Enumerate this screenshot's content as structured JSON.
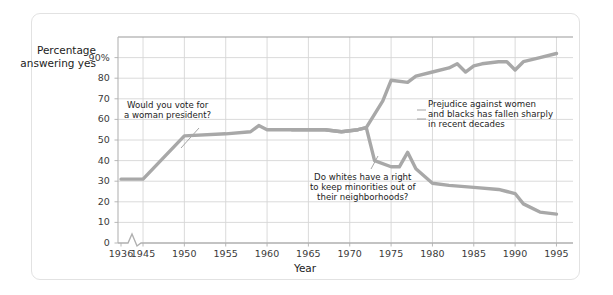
{
  "card": {
    "background": "#ffffff",
    "border_color": "#e2e2e2"
  },
  "axes": {
    "y_label": "Percentage\nanswering yes",
    "x_label": "Year",
    "y_ticks": [
      "90%",
      "80",
      "70",
      "60",
      "50",
      "40",
      "30",
      "20",
      "10",
      "0"
    ],
    "x_ticks": [
      "1936",
      "1945",
      "1950",
      "1955",
      "1960",
      "1965",
      "1970",
      "1975",
      "1980",
      "1985",
      "1990",
      "1995"
    ],
    "axis_break": true
  },
  "annotations": {
    "woman_president": "Would you vote for\na woman president?",
    "whites_neighborhoods": "Do whites have a right\nto keep minorities out of\ntheir neighborhoods?",
    "summary": "Prejudice against women\nand blacks has fallen sharply\nin recent decades"
  },
  "colors": {
    "line": "#a8a8a8",
    "grid": "#d6d6d6",
    "axis": "#9a9a9a",
    "text": "#1c1c1c",
    "tick_text": "#3a3a3a"
  },
  "chart_data": {
    "type": "line",
    "title": "",
    "xlabel": "Year",
    "ylabel": "Percentage answering yes",
    "xlim": [
      1936,
      1997
    ],
    "ylim": [
      0,
      100
    ],
    "grid": true,
    "legend": "none",
    "x_tick_values": [
      1936,
      1945,
      1950,
      1955,
      1960,
      1965,
      1970,
      1975,
      1980,
      1985,
      1990,
      1995
    ],
    "y_tick_values": [
      0,
      10,
      20,
      30,
      40,
      50,
      60,
      70,
      80,
      90
    ],
    "axis_break_after": 1936,
    "series": [
      {
        "name": "Would you vote for a woman president?",
        "color": "#a8a8a8",
        "points": [
          [
            1936,
            31
          ],
          [
            1945,
            31
          ],
          [
            1950,
            52
          ],
          [
            1955,
            53
          ],
          [
            1958,
            54
          ],
          [
            1959,
            57
          ],
          [
            1960,
            55
          ],
          [
            1963,
            55
          ],
          [
            1967,
            55
          ],
          [
            1969,
            54
          ],
          [
            1971,
            55
          ],
          [
            1972,
            56
          ],
          [
            1974,
            69
          ],
          [
            1975,
            79
          ],
          [
            1977,
            78
          ],
          [
            1978,
            81
          ],
          [
            1980,
            83
          ],
          [
            1982,
            85
          ],
          [
            1983,
            87
          ],
          [
            1984,
            83
          ],
          [
            1985,
            86
          ],
          [
            1986,
            87
          ],
          [
            1988,
            88
          ],
          [
            1989,
            88
          ],
          [
            1990,
            84
          ],
          [
            1991,
            88
          ],
          [
            1993,
            90
          ],
          [
            1995,
            92
          ]
        ]
      },
      {
        "name": "Do whites have a right to keep minorities out of their neighborhoods?",
        "color": "#a8a8a8",
        "points": [
          [
            1963,
            55
          ],
          [
            1967,
            55
          ],
          [
            1969,
            54
          ],
          [
            1971,
            55
          ],
          [
            1972,
            56
          ],
          [
            1973,
            40
          ],
          [
            1975,
            37
          ],
          [
            1976,
            37
          ],
          [
            1977,
            44
          ],
          [
            1978,
            36
          ],
          [
            1980,
            29
          ],
          [
            1982,
            28
          ],
          [
            1985,
            27
          ],
          [
            1988,
            26
          ],
          [
            1989,
            25
          ],
          [
            1990,
            24
          ],
          [
            1991,
            19
          ],
          [
            1993,
            15
          ],
          [
            1995,
            14
          ]
        ]
      }
    ]
  }
}
